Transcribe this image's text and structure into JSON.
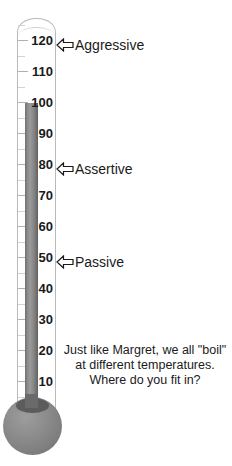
{
  "figure": {
    "colors": {
      "mercury": "#8a8a8a",
      "bulb": "#8e8e8e",
      "glass": "#b9b9b9",
      "text": "#1a1a1a",
      "background": "#ffffff"
    }
  },
  "scale": {
    "unit_min": 0,
    "unit_max": 125,
    "major_step": 10,
    "minor_step": 5,
    "labels": [
      {
        "value": 120,
        "text": "120",
        "y": 40
      },
      {
        "value": 110,
        "text": "110",
        "y": 71
      },
      {
        "value": 100,
        "text": "100",
        "y": 102
      },
      {
        "value": 90,
        "text": "90",
        "y": 133
      },
      {
        "value": 80,
        "text": "80",
        "y": 164
      },
      {
        "value": 70,
        "text": "70",
        "y": 195
      },
      {
        "value": 60,
        "text": "60",
        "y": 226
      },
      {
        "value": 50,
        "text": "50",
        "y": 257
      },
      {
        "value": 40,
        "text": "40",
        "y": 288
      },
      {
        "value": 30,
        "text": "30",
        "y": 319
      },
      {
        "value": 20,
        "text": "20",
        "y": 350
      },
      {
        "value": 10,
        "text": "10",
        "y": 381
      }
    ]
  },
  "pointers": [
    {
      "label": "Aggressive",
      "value": 120,
      "icon": "left-arrow-icon",
      "y": 38
    },
    {
      "label": "Assertive",
      "value": 80,
      "icon": "left-arrow-icon",
      "y": 162
    },
    {
      "label": "Passive",
      "value": 50,
      "icon": "left-arrow-icon",
      "y": 255
    }
  ],
  "reading": {
    "mercury_top_value": 100,
    "mercury_top_label": "100"
  },
  "caption": {
    "line1": "Just like Margret, we all \"boil\"",
    "line2": "at different temperatures.",
    "line3": "Where do you fit in?"
  }
}
